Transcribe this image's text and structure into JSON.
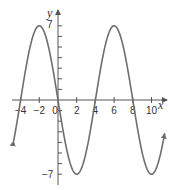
{
  "chart_data": {
    "type": "line",
    "title": "",
    "xlabel": "x",
    "ylabel": "y",
    "function": "y = -7 sin(pi x / 4)",
    "series": [
      {
        "name": "curve",
        "color": "#6e6e6e",
        "x": [
          -4.8,
          -4,
          -3,
          -2,
          -1,
          0,
          1,
          2,
          3,
          4,
          5,
          6,
          7,
          8,
          9,
          10,
          11.4
        ],
        "y": [
          3.92,
          0,
          4.95,
          7,
          4.95,
          0,
          -4.95,
          -7,
          -4.95,
          0,
          4.95,
          7,
          4.95,
          0,
          -4.95,
          -7,
          -4.11
        ]
      }
    ],
    "x_ticks": [
      -4,
      -2,
      0,
      2,
      4,
      6,
      8,
      10
    ],
    "x_tick_labels": [
      "-4",
      "-2",
      "0",
      "2",
      "4",
      "6",
      "8",
      "10"
    ],
    "y_tick_labels": [
      "7",
      "-7"
    ],
    "y_ticks_minor": [
      -7,
      -6,
      -5,
      -4,
      -3,
      -2,
      -1,
      1,
      2,
      3,
      4,
      5,
      6,
      7
    ],
    "xlim": [
      -5,
      11.5
    ],
    "ylim": [
      -8,
      8
    ],
    "grid": false,
    "legend": false
  },
  "labels": {
    "x_axis": "x",
    "y_axis": "y",
    "y_max": "7",
    "y_min": "−7",
    "x_ticks": [
      "−4",
      "−2",
      "0",
      "2",
      "4",
      "6",
      "8",
      "10"
    ]
  }
}
